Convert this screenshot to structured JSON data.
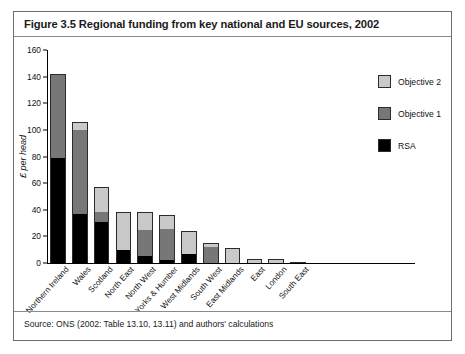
{
  "figure": {
    "title": "Figure 3.5 Regional funding from key national and EU sources, 2002",
    "source": "Source: ONS (2002: Table 13.10, 13.11) and authors' calculations"
  },
  "colors": {
    "objective2": "#c9c9c9",
    "objective1": "#777777",
    "rsa": "#000000",
    "frame": "#6e6e6e",
    "background": "#ffffff"
  },
  "legend": {
    "position": "right",
    "entries": [
      {
        "label": "Objective 2",
        "color": "#c9c9c9"
      },
      {
        "label": "Objective 1",
        "color": "#777777"
      },
      {
        "label": "RSA",
        "color": "#000000"
      }
    ]
  },
  "chart_data": {
    "type": "bar",
    "stacked": true,
    "title": "Figure 3.5 Regional funding from key national and EU sources, 2002",
    "xlabel": "",
    "ylabel": "£ per head",
    "ylim": [
      0,
      160
    ],
    "yticks": [
      0,
      20,
      40,
      60,
      80,
      100,
      120,
      140,
      160
    ],
    "grid": false,
    "categories": [
      "Northern Ireland",
      "Wales",
      "Scotland",
      "North East",
      "North West",
      "Yorks & Humber",
      "West Midlands",
      "South West",
      "East Midlands",
      "East",
      "London",
      "South East"
    ],
    "series": [
      {
        "name": "RSA",
        "color": "#000000",
        "values": [
          79,
          37,
          31,
          10,
          5,
          2,
          7,
          0,
          0,
          0,
          0,
          0
        ]
      },
      {
        "name": "Objective 1",
        "color": "#777777",
        "values": [
          63,
          64,
          8,
          0,
          20,
          24,
          0,
          13,
          0,
          0,
          0,
          0
        ]
      },
      {
        "name": "Objective 2",
        "color": "#c9c9c9",
        "values": [
          0,
          5,
          18,
          28,
          13,
          10,
          17,
          2,
          11,
          3,
          3,
          1
        ]
      }
    ],
    "totals": [
      142,
      106,
      57,
      38,
      38,
      36,
      24,
      15,
      11,
      3,
      3,
      1
    ]
  }
}
